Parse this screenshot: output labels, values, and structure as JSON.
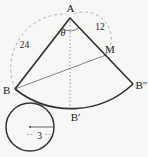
{
  "colors": {
    "background": "#f7f7f5",
    "primary_line": "#333333",
    "thin_line": "#777777",
    "dash_line": "#a0a0a0",
    "text": "#222222"
  },
  "labels": {
    "apex": "A",
    "vertex_b": "B",
    "vertex_b_double_prime": "B″",
    "arc_point_b_prime": "B′",
    "point_m": "M",
    "angle_theta": "θ",
    "length_ab": "24",
    "length_am": "12",
    "circle_radius": "3"
  }
}
